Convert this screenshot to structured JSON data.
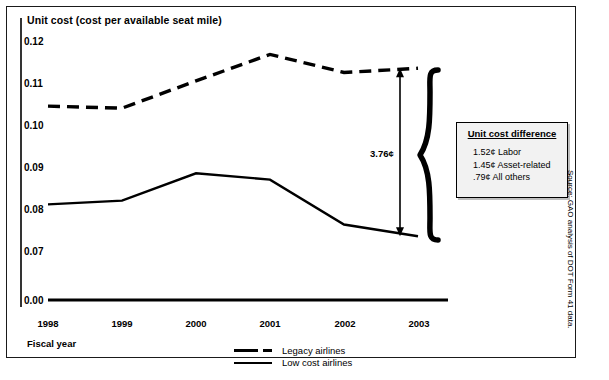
{
  "chart_data": {
    "type": "line",
    "title": "Unit cost (cost per available seat mile)",
    "xlabel": "Fiscal year",
    "ylabel": "Unit cost (cost per available seat mile)",
    "categories": [
      "1998",
      "1999",
      "2000",
      "2001",
      "2002",
      "2003"
    ],
    "yticks": [
      "0.12",
      "0.11",
      "0.10",
      "0.09",
      "0.08",
      "0.07",
      "0.00"
    ],
    "ytick_values": [
      0.12,
      0.11,
      0.1,
      0.09,
      0.08,
      0.07,
      0.0
    ],
    "ylim": [
      0.07,
      0.12
    ],
    "axis_break": true,
    "grid": false,
    "legend_position": "bottom-center",
    "series": [
      {
        "name": "Legacy airlines",
        "style": "dashed",
        "values": [
          0.1045,
          0.104,
          0.1105,
          0.1168,
          0.1125,
          0.1135
        ]
      },
      {
        "name": "Low cost airlines",
        "style": "solid",
        "values": [
          0.0811,
          0.082,
          0.0885,
          0.087,
          0.0763,
          0.0735
        ]
      }
    ],
    "annotations": [
      {
        "name": "difference-arrow",
        "label": "3.76¢",
        "at_category": "2003",
        "from": 0.1135,
        "to": 0.0735
      }
    ]
  },
  "callout": {
    "title": "Unit cost difference",
    "items": [
      "1.52¢ Labor",
      "1.45¢ Asset-related",
      ".79¢ All others"
    ]
  },
  "legend": {
    "entries": [
      {
        "label": "Legacy airlines",
        "style": "dashed"
      },
      {
        "label": "Low cost airlines",
        "style": "solid"
      }
    ]
  },
  "source": "Source: GAO analysis of DOT Form 41 data."
}
